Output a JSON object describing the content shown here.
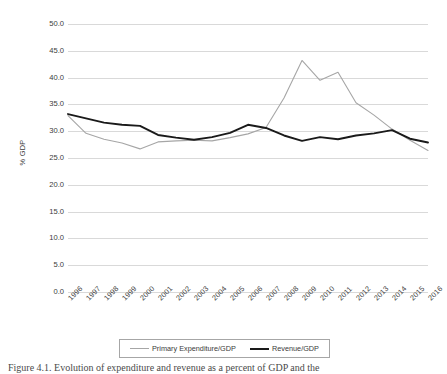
{
  "figure": {
    "caption": "Figure 4.1. Evolution of expenditure and revenue as a percent of GDP and the"
  },
  "chart_data": {
    "type": "line",
    "title": "",
    "xlabel": "",
    "ylabel": "% GDP",
    "ylim": [
      0.0,
      50.0
    ],
    "yticks": [
      "0.0",
      "5.0",
      "10.0",
      "15.0",
      "20.0",
      "25.0",
      "30.0",
      "35.0",
      "40.0",
      "45.0",
      "50.0"
    ],
    "ytick_values": [
      0.0,
      5.0,
      10.0,
      15.0,
      20.0,
      25.0,
      30.0,
      35.0,
      40.0,
      45.0,
      50.0
    ],
    "grid": true,
    "legend_position": "bottom",
    "categories": [
      "1996",
      "1997",
      "1998",
      "1999",
      "2000",
      "2001",
      "2002",
      "2003",
      "2004",
      "2005",
      "2006",
      "2007",
      "2008",
      "2009",
      "2010",
      "2011",
      "2012",
      "2013",
      "2014",
      "2015",
      "2016"
    ],
    "series": [
      {
        "name": "Primary Expenditure/GDP",
        "color": "#a6a6a6",
        "width": 1.1,
        "values": [
          32.9,
          29.6,
          28.5,
          27.8,
          26.7,
          28.0,
          28.2,
          28.3,
          28.2,
          28.8,
          29.5,
          30.7,
          36.2,
          43.2,
          39.5,
          41.0,
          35.3,
          33.0,
          30.4,
          28.3,
          26.4
        ]
      },
      {
        "name": "Revenue/GDP",
        "color": "#1a1a1a",
        "width": 1.9,
        "values": [
          33.2,
          32.4,
          31.6,
          31.2,
          31.0,
          29.3,
          28.8,
          28.4,
          28.9,
          29.7,
          31.2,
          30.6,
          29.2,
          28.2,
          28.9,
          28.5,
          29.2,
          29.6,
          30.2,
          28.6,
          27.9
        ]
      }
    ]
  },
  "legend": {
    "entries": [
      {
        "label": "Primary Expenditure/GDP"
      },
      {
        "label": "Revenue/GDP"
      }
    ]
  }
}
